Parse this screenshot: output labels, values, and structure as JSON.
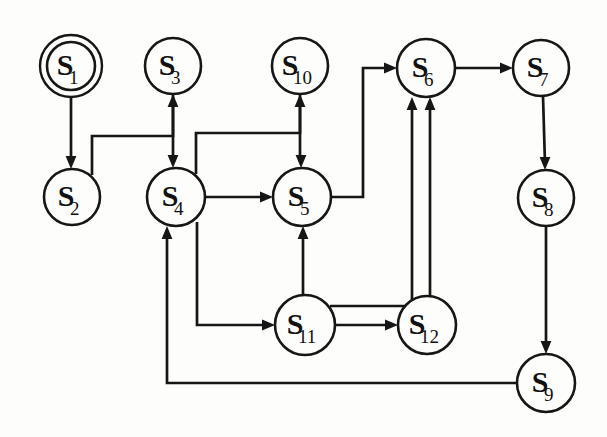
{
  "diagram": {
    "type": "state-machine",
    "canvas": {
      "width": 607,
      "height": 437
    },
    "nodes": [
      {
        "id": "S1",
        "label": "S",
        "sub": "1",
        "cx": 71,
        "cy": 66,
        "r": 31,
        "double": true,
        "name": "state-node-s1"
      },
      {
        "id": "S2",
        "label": "S",
        "sub": "2",
        "cx": 72,
        "cy": 197,
        "r": 28,
        "double": false,
        "name": "state-node-s2"
      },
      {
        "id": "S3",
        "label": "S",
        "sub": "3",
        "cx": 173,
        "cy": 66,
        "r": 28,
        "double": false,
        "name": "state-node-s3"
      },
      {
        "id": "S4",
        "label": "S",
        "sub": "4",
        "cx": 176,
        "cy": 197,
        "r": 29,
        "double": false,
        "name": "state-node-s4"
      },
      {
        "id": "S5",
        "label": "S",
        "sub": "5",
        "cx": 302,
        "cy": 197,
        "r": 29,
        "double": false,
        "name": "state-node-s5"
      },
      {
        "id": "S6",
        "label": "S",
        "sub": "6",
        "cx": 426,
        "cy": 68,
        "r": 29,
        "double": false,
        "name": "state-node-s6"
      },
      {
        "id": "S7",
        "label": "S",
        "sub": "7",
        "cx": 541,
        "cy": 68,
        "r": 28,
        "double": false,
        "name": "state-node-s7"
      },
      {
        "id": "S8",
        "label": "S",
        "sub": "8",
        "cx": 546,
        "cy": 198,
        "r": 28,
        "double": false,
        "name": "state-node-s8"
      },
      {
        "id": "S9",
        "label": "S",
        "sub": "9",
        "cx": 546,
        "cy": 383,
        "r": 29,
        "double": false,
        "name": "state-node-s9"
      },
      {
        "id": "S10",
        "label": "S",
        "sub": "10",
        "cx": 300,
        "cy": 66,
        "r": 28,
        "double": false,
        "name": "state-node-s10"
      },
      {
        "id": "S11",
        "label": "S",
        "sub": "11",
        "cx": 305,
        "cy": 325,
        "r": 30,
        "double": false,
        "name": "state-node-s11"
      },
      {
        "id": "S12",
        "label": "S",
        "sub": "12",
        "cx": 427,
        "cy": 325,
        "r": 29,
        "double": false,
        "name": "state-node-s12"
      }
    ],
    "edges": [
      {
        "id": "e1",
        "from": "S1",
        "to": "S2",
        "name": "edge-s1-s2",
        "d": "M 71 97 L 71 163",
        "arrow": {
          "x": 71,
          "y": 169,
          "dir": "down"
        }
      },
      {
        "id": "e2",
        "from": "S2",
        "to": "S3",
        "name": "edge-s2-s3",
        "d": "M 92 175 L 92 136 L 173 136 L 173 100",
        "arrow": {
          "x": 173,
          "y": 94,
          "dir": "up"
        }
      },
      {
        "id": "e3",
        "from": "S3",
        "to": "S4",
        "name": "edge-s3-s4",
        "d": "M 173 94 L 173 162",
        "arrow": {
          "x": 173,
          "y": 168,
          "dir": "down"
        }
      },
      {
        "id": "e4",
        "from": "S4",
        "to": "S10",
        "name": "edge-s4-s10",
        "d": "M 196 174 L 196 133 L 300 133 L 300 100",
        "arrow": {
          "x": 300,
          "y": 94,
          "dir": "up"
        }
      },
      {
        "id": "e5",
        "from": "S10",
        "to": "S5",
        "name": "edge-s10-s5",
        "d": "M 300 94 L 300 162",
        "arrow": {
          "x": 301,
          "y": 168,
          "dir": "down"
        }
      },
      {
        "id": "e6",
        "from": "S4",
        "to": "S5",
        "name": "edge-s4-s5",
        "d": "M 205 197 L 267 197",
        "arrow": {
          "x": 273,
          "y": 197,
          "dir": "right"
        }
      },
      {
        "id": "e7",
        "from": "S5",
        "to": "S6",
        "name": "edge-s5-s6",
        "d": "M 331 197 L 363 197 L 363 68 L 391 68",
        "arrow": {
          "x": 397,
          "y": 68,
          "dir": "right"
        }
      },
      {
        "id": "e8",
        "from": "S6",
        "to": "S7",
        "name": "edge-s6-s7",
        "d": "M 455 68 L 507 68",
        "arrow": {
          "x": 513,
          "y": 68,
          "dir": "right"
        }
      },
      {
        "id": "e9",
        "from": "S7",
        "to": "S8",
        "name": "edge-s7-s8",
        "d": "M 543 96 L 545 164",
        "arrow": {
          "x": 545,
          "y": 170,
          "dir": "down"
        }
      },
      {
        "id": "e10",
        "from": "S8",
        "to": "S9",
        "name": "edge-s8-s9",
        "d": "M 546 226 L 546 348",
        "arrow": {
          "x": 546,
          "y": 354,
          "dir": "down"
        }
      },
      {
        "id": "e11",
        "from": "S9",
        "to": "S4",
        "name": "edge-s9-s4",
        "d": "M 517 383 L 167 383 L 167 232",
        "arrow": {
          "x": 167,
          "y": 226,
          "dir": "up"
        }
      },
      {
        "id": "e12",
        "from": "S4",
        "to": "S11",
        "name": "edge-s4-s11",
        "d": "M 197 222 L 197 325 L 269 325",
        "arrow": {
          "x": 275,
          "y": 325,
          "dir": "right"
        }
      },
      {
        "id": "e13",
        "from": "S11",
        "to": "S5",
        "name": "edge-s11-s5",
        "d": "M 303 295 L 303 232",
        "arrow": {
          "x": 303,
          "y": 226,
          "dir": "up"
        }
      },
      {
        "id": "e14",
        "from": "S11",
        "to": "S12",
        "name": "edge-s11-s12",
        "d": "M 335 325 L 392 325",
        "arrow": {
          "x": 398,
          "y": 325,
          "dir": "right"
        }
      },
      {
        "id": "e15",
        "from": "S11",
        "to": "S6",
        "name": "edge-s11-s6",
        "d": "M 330 306 L 412 306 L 412 103",
        "arrow": {
          "x": 412,
          "y": 97,
          "dir": "up"
        }
      },
      {
        "id": "e16",
        "from": "S12",
        "to": "S6",
        "name": "edge-s12-s6",
        "d": "M 430 296 L 430 103",
        "arrow": {
          "x": 430,
          "y": 97,
          "dir": "up"
        }
      }
    ]
  }
}
